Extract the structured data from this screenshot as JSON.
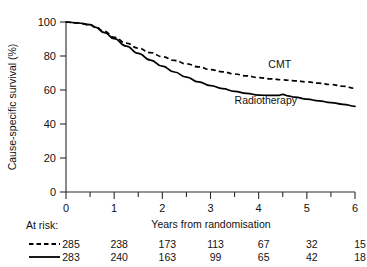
{
  "chart_data": {
    "type": "line",
    "title": "",
    "xlabel": "Years from randomisation",
    "ylabel": "Cause-specific survival (%)",
    "xlim": [
      0,
      6
    ],
    "ylim": [
      0,
      100
    ],
    "grid": false,
    "legend_position": "inline-annotation",
    "x_ticks": [
      "0",
      "1",
      "2",
      "3",
      "4",
      "5",
      "6"
    ],
    "x_tick_values": [
      0,
      1,
      2,
      3,
      4,
      5,
      6
    ],
    "x_minor_tick_values": [
      0.5,
      1.5,
      2.5,
      3.5,
      4.5,
      5.5
    ],
    "y_ticks": [
      "0",
      "20",
      "40",
      "60",
      "80",
      "100"
    ],
    "y_tick_values": [
      0,
      20,
      40,
      60,
      80,
      100
    ],
    "series": [
      {
        "name": "CMT",
        "style": "dashed",
        "label_text": "CMT",
        "x": [
          0,
          0.25,
          0.5,
          0.6,
          0.8,
          1.0,
          1.25,
          1.5,
          1.75,
          2.0,
          2.25,
          2.5,
          2.75,
          3.0,
          3.25,
          3.5,
          3.75,
          4.0,
          4.25,
          4.5,
          4.75,
          5.0,
          5.25,
          5.5,
          5.75,
          6.0
        ],
        "values": [
          100,
          99.4,
          98.4,
          97.2,
          94.5,
          91.0,
          87.6,
          84.6,
          82.0,
          79.6,
          77.4,
          75.4,
          73.6,
          72.0,
          70.7,
          69.4,
          68.3,
          67.3,
          66.6,
          66.0,
          65.4,
          64.8,
          64.0,
          63.2,
          62.2,
          61.0
        ]
      },
      {
        "name": "Radiotherapy",
        "style": "solid",
        "label_text": "Radiotherapy",
        "x": [
          0,
          0.25,
          0.5,
          0.6,
          0.8,
          1.0,
          1.25,
          1.5,
          1.75,
          2.0,
          2.25,
          2.5,
          2.75,
          3.0,
          3.25,
          3.5,
          3.75,
          4.0,
          4.25,
          4.4,
          4.5,
          4.6,
          4.75,
          5.0,
          5.25,
          5.5,
          5.75,
          6.0
        ],
        "values": [
          100,
          99.4,
          98.4,
          97.0,
          93.8,
          90.2,
          85.8,
          81.6,
          77.6,
          74.0,
          70.6,
          67.6,
          64.8,
          62.6,
          60.8,
          59.2,
          58.0,
          57.0,
          56.8,
          56.8,
          57.4,
          56.6,
          55.8,
          54.6,
          53.6,
          52.6,
          51.6,
          50.4
        ]
      }
    ],
    "annotations": [
      {
        "text": "CMT",
        "x": 4.2,
        "y": 73.0
      },
      {
        "text": "Radiotherapy",
        "x": 3.5,
        "y": 52.0
      }
    ],
    "at_risk": {
      "label": "At risk:",
      "times": [
        0,
        1,
        2,
        3,
        4,
        5,
        6
      ],
      "rows": [
        {
          "series": "CMT",
          "style": "dashed",
          "counts": [
            "285",
            "238",
            "173",
            "113",
            "67",
            "32",
            "15"
          ]
        },
        {
          "series": "Radiotherapy",
          "style": "solid",
          "counts": [
            "283",
            "240",
            "163",
            "99",
            "65",
            "42",
            "18"
          ]
        }
      ]
    },
    "colors": {
      "axis": "#2b2b2b",
      "curve": "#000000",
      "text": "#111111",
      "background": "#ffffff"
    }
  }
}
